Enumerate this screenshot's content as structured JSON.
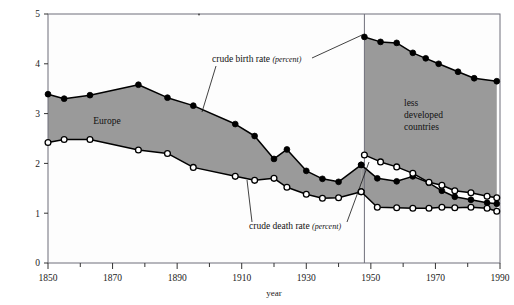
{
  "chart_data": {
    "type": "area",
    "title": "",
    "xlabel": "year",
    "ylabel": "",
    "xlim": [
      1850,
      1990
    ],
    "ylim": [
      0,
      5
    ],
    "grid": false,
    "legend_position": "inline-annotations",
    "x_ticks_major": [
      1850,
      1870,
      1890,
      1910,
      1930,
      1950,
      1970,
      1990
    ],
    "x_ticks_minor": [
      1860,
      1880,
      1900,
      1920,
      1940,
      1960,
      1980
    ],
    "y_ticks": [
      0,
      1,
      2,
      3,
      4,
      5
    ],
    "divider_year": 1948,
    "annotations": [
      {
        "name": "crude-birth-rate",
        "text": "crude birth rate",
        "emphasis": "(percent)"
      },
      {
        "name": "crude-death-rate",
        "text": "crude death rate",
        "emphasis": "(percent)"
      },
      {
        "name": "europe-region",
        "text": "Europe"
      },
      {
        "name": "ldc-region",
        "lines": [
          "less",
          "developed",
          "countries"
        ]
      }
    ],
    "series": [
      {
        "name": "Europe crude birth rate (percent)",
        "marker": "filled-circle",
        "points": [
          [
            1850,
            3.39
          ],
          [
            1855,
            3.3
          ],
          [
            1863,
            3.37
          ],
          [
            1878,
            3.58
          ],
          [
            1887,
            3.32
          ],
          [
            1895,
            3.16
          ],
          [
            1908,
            2.79
          ],
          [
            1914,
            2.55
          ],
          [
            1920,
            2.09
          ],
          [
            1924,
            2.28
          ],
          [
            1930,
            1.85
          ],
          [
            1935,
            1.69
          ],
          [
            1940,
            1.63
          ],
          [
            1947,
            1.97
          ]
        ]
      },
      {
        "name": "Europe crude death rate (percent)",
        "marker": "open-circle",
        "points": [
          [
            1850,
            2.42
          ],
          [
            1855,
            2.48
          ],
          [
            1863,
            2.48
          ],
          [
            1878,
            2.27
          ],
          [
            1887,
            2.2
          ],
          [
            1895,
            1.92
          ],
          [
            1908,
            1.74
          ],
          [
            1914,
            1.66
          ],
          [
            1920,
            1.7
          ],
          [
            1924,
            1.52
          ],
          [
            1930,
            1.38
          ],
          [
            1935,
            1.3
          ],
          [
            1940,
            1.31
          ],
          [
            1947,
            1.43
          ]
        ]
      },
      {
        "name": "Europe crude birth rate (percent) post-1948",
        "marker": "filled-circle",
        "points": [
          [
            1947,
            1.97
          ],
          [
            1952,
            1.7
          ],
          [
            1958,
            1.64
          ],
          [
            1963,
            1.74
          ],
          [
            1968,
            1.61
          ],
          [
            1972,
            1.45
          ],
          [
            1976,
            1.33
          ],
          [
            1981,
            1.27
          ],
          [
            1986,
            1.21
          ],
          [
            1989,
            1.19
          ]
        ]
      },
      {
        "name": "Europe crude death rate (percent) post-1948",
        "marker": "open-circle",
        "points": [
          [
            1947,
            1.43
          ],
          [
            1952,
            1.12
          ],
          [
            1958,
            1.11
          ],
          [
            1963,
            1.1
          ],
          [
            1968,
            1.1
          ],
          [
            1972,
            1.12
          ],
          [
            1976,
            1.11
          ],
          [
            1981,
            1.12
          ],
          [
            1986,
            1.1
          ],
          [
            1989,
            1.04
          ]
        ]
      },
      {
        "name": "Less developed countries crude birth rate (percent)",
        "marker": "filled-circle",
        "points": [
          [
            1948,
            4.54
          ],
          [
            1953,
            4.44
          ],
          [
            1958,
            4.42
          ],
          [
            1963,
            4.22
          ],
          [
            1967,
            4.11
          ],
          [
            1971,
            4.0
          ],
          [
            1977,
            3.84
          ],
          [
            1982,
            3.71
          ],
          [
            1989,
            3.65
          ]
        ]
      },
      {
        "name": "Less developed countries crude death rate (percent)",
        "marker": "open-circle",
        "points": [
          [
            1948,
            2.17
          ],
          [
            1953,
            2.03
          ],
          [
            1958,
            1.93
          ],
          [
            1963,
            1.8
          ],
          [
            1968,
            1.62
          ],
          [
            1972,
            1.56
          ],
          [
            1976,
            1.45
          ],
          [
            1981,
            1.41
          ],
          [
            1986,
            1.34
          ],
          [
            1989,
            1.31
          ]
        ]
      }
    ],
    "colors": {
      "fill": "#9a9a9a",
      "line": "#000000",
      "marker_open_fill": "#ffffff",
      "frame": "#6f6f7a",
      "text": "#111111"
    }
  }
}
